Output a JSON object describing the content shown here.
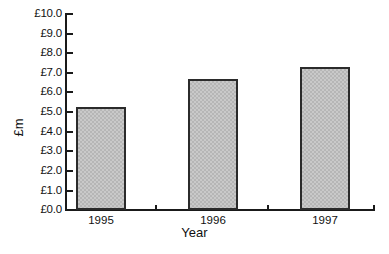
{
  "chart_data": {
    "type": "bar",
    "title": "",
    "subtitle": "",
    "xlabel": "Year",
    "ylabel": "£m",
    "categories": [
      "1995",
      "1996",
      "1997"
    ],
    "values": [
      5.2,
      6.65,
      7.25
    ],
    "series": [
      {
        "name": "Turnover",
        "values": [
          5.2,
          6.65,
          7.25
        ]
      }
    ],
    "ylim": [
      0.0,
      10.0
    ],
    "ytick_step": 1.0,
    "ytick_labels": [
      "£10.0",
      "£9.0",
      "£8.0",
      "£7.0",
      "£6.0",
      "£5.0",
      "£4.0",
      "£3.0",
      "£2.0",
      "£1.0",
      "£0.0"
    ],
    "ytick_values": [
      10.0,
      9.0,
      8.0,
      7.0,
      6.0,
      5.0,
      4.0,
      3.0,
      2.0,
      1.0,
      0.0
    ],
    "xtick_labels": [
      "1995",
      "1996",
      "1997"
    ],
    "grid": false,
    "legend": false,
    "legend_position": "none",
    "bar_fill_color": "#c9c9c9",
    "bar_border_color": "#2b2b2b",
    "axis_color": "#1a1a1a",
    "background_color": "#ffffff",
    "annotations": []
  }
}
